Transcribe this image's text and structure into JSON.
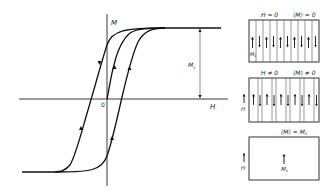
{
  "figure": {
    "plot": {
      "axis_y_label": "M",
      "axis_x_label": "H",
      "origin_label": "0",
      "saturation_label": "M",
      "saturation_sub": "s",
      "curves": [
        "initial magnetization curve",
        "descending branch",
        "ascending branch"
      ]
    },
    "panels": [
      {
        "id": "zero-field",
        "condition_left": "H = 0",
        "condition_right": "⟨M⟩ = 0",
        "side_label": "M",
        "side_sub": "s",
        "domains": [
          "up",
          "down",
          "up",
          "down",
          "up",
          "down",
          "up",
          "down",
          "up",
          "down"
        ]
      },
      {
        "id": "applied-field",
        "condition_left": "H ≠ 0",
        "condition_right": "⟨M⟩ ≠ 0",
        "side_label": "H",
        "domains": [
          "up",
          "down",
          "up",
          "down",
          "up",
          "down",
          "up",
          "down",
          "up",
          "down"
        ]
      },
      {
        "id": "saturated",
        "condition": "⟨M⟩ = M",
        "condition_sub": "s",
        "side_label": "H",
        "center_label": "M",
        "center_sub": "s"
      }
    ]
  }
}
